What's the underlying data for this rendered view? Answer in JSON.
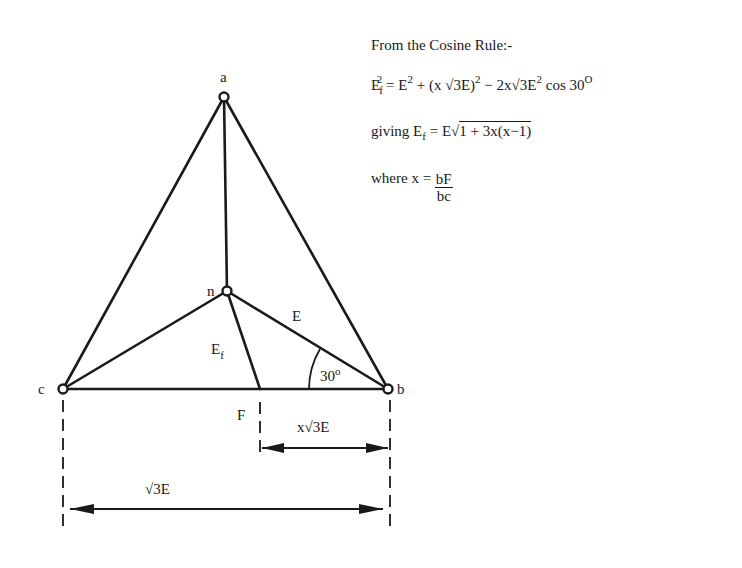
{
  "heading": "From the Cosine Rule:-",
  "equation1": {
    "lhs_base": "E",
    "lhs_sub": "f",
    "lhs_sup": "2",
    "eq": "=",
    "t1_base": "E",
    "t1_sup": "2",
    "plus": "+",
    "t2": "(x √3E)",
    "t2_sup": "2",
    "minus": "−",
    "t3": "2x√3E",
    "t3_sup": "2",
    "t3_cos": "cos 30",
    "t3_deg": "O"
  },
  "equation2": {
    "prefix": "giving E",
    "sub": "f",
    "eq": "= E√",
    "radicand": "1 + 3x(x−1)"
  },
  "equation3": {
    "prefix": "where x =",
    "numerator": "bF",
    "denominator": "bc"
  },
  "diagram": {
    "nodes": {
      "a": {
        "label": "a",
        "x": 224,
        "y": 97
      },
      "n": {
        "label": "n",
        "x": 227,
        "y": 291
      },
      "c": {
        "label": "c",
        "x": 63,
        "y": 389
      },
      "b": {
        "label": "b",
        "x": 388,
        "y": 389
      },
      "F": {
        "label": "F",
        "x": 260,
        "y": 389
      }
    },
    "labels": {
      "E": "E",
      "Ef_base": "E",
      "Ef_sub": "f",
      "angle": "30",
      "angle_deg": "o",
      "dim_short": "x√3E",
      "dim_long": "√3E"
    }
  }
}
